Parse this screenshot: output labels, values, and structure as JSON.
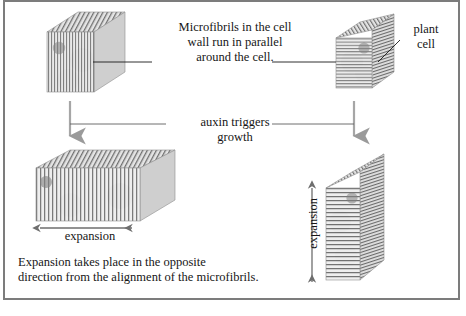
{
  "figure": {
    "background": "#ffffff",
    "frame_color": "#7c7c7c",
    "text_color": "#161616"
  },
  "annotations": {
    "microfibril_caption": "Microfibrils in the cell\nwall run in parallel\naround the cell.",
    "plant_cell_label": "plant\ncell",
    "auxin_label": "auxin triggers\ngrowth",
    "expansion_horizontal": "expansion",
    "expansion_vertical": "expansion",
    "bottom_caption": "Expansion takes place in the opposite\ndirection from the alignment of the microfibrils."
  },
  "cells": [
    {
      "id": "cell-top-left",
      "position": "top-left",
      "fibril_orientation": "vertical",
      "state": "before-growth",
      "nucleus": "dark-gray-circle",
      "body_color": "#e8e8e8",
      "fibril_color": "#5a5a5a",
      "nucleus_color": "#8a8a8a"
    },
    {
      "id": "cell-top-right",
      "position": "top-right",
      "fibril_orientation": "horizontal",
      "state": "before-growth",
      "nucleus": "dark-gray-circle",
      "body_color": "#e8e8e8",
      "fibril_color": "#5a5a5a",
      "nucleus_color": "#8a8a8a"
    },
    {
      "id": "cell-bottom-left",
      "position": "bottom-left",
      "fibril_orientation": "vertical",
      "state": "expanded-horizontally",
      "nucleus": "dark-gray-circle",
      "body_color": "#e8e8e8",
      "fibril_color": "#5a5a5a",
      "nucleus_color": "#8a8a8a"
    },
    {
      "id": "cell-bottom-right",
      "position": "bottom-right",
      "fibril_orientation": "horizontal",
      "state": "expanded-vertically",
      "nucleus": "dark-gray-circle",
      "body_color": "#e8e8e8",
      "fibril_color": "#5a5a5a",
      "nucleus_color": "#8a8a8a"
    }
  ],
  "arrows": [
    {
      "id": "growth-arrow-left",
      "direction": "down",
      "meaning": "auxin triggers growth"
    },
    {
      "id": "growth-arrow-right",
      "direction": "down",
      "meaning": "auxin triggers growth"
    },
    {
      "id": "expansion-arrow-horizontal",
      "direction": "double-horizontal",
      "meaning": "expansion"
    },
    {
      "id": "expansion-arrow-vertical",
      "direction": "double-vertical",
      "meaning": "expansion"
    }
  ],
  "leader_lines": [
    {
      "id": "leader-left",
      "from": "microfibril_caption",
      "to": "cell-top-left"
    },
    {
      "id": "leader-right",
      "from": "microfibril_caption",
      "to": "cell-top-right"
    },
    {
      "id": "leader-plant-cell",
      "from": "plant_cell_label",
      "to": "cell-top-right"
    }
  ]
}
